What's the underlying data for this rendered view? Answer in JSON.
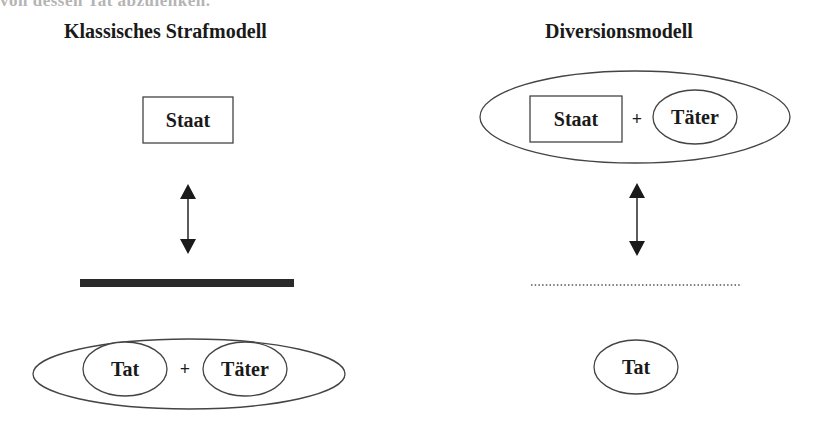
{
  "cutoff_text": "von dessen Tat abzulenken.",
  "left_model": {
    "title": "Klassisches Strafmodell",
    "top_box": "Staat",
    "separator": "solid-thick-bar",
    "bottom_group": {
      "left": "Tat",
      "operator": "+",
      "right": "Täter"
    }
  },
  "right_model": {
    "title": "Diversionsmodell",
    "top_group": {
      "left": "Staat",
      "operator": "+",
      "right": "Täter"
    },
    "separator": "dotted-line",
    "bottom_item": "Tat"
  },
  "colors": {
    "stroke": "#444444",
    "text": "#1a1a1a",
    "bar": "#2a2a2a",
    "background": "#ffffff"
  }
}
